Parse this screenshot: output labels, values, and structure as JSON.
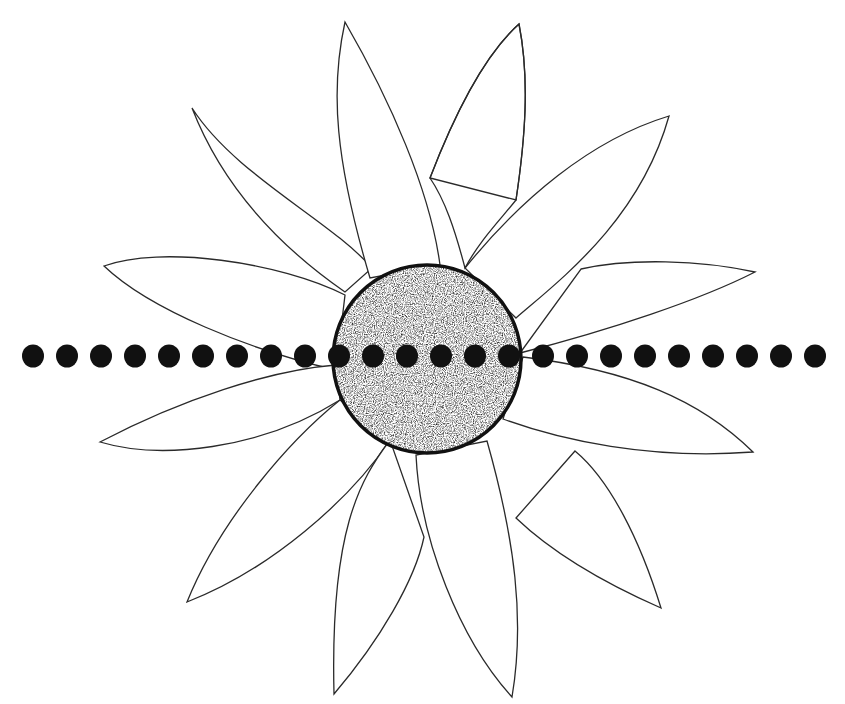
{
  "figure": {
    "background_color": "#ffffff",
    "line_color": "#2a2a2a",
    "petal_count": 16,
    "center": {
      "label": "stippled-center-disc",
      "cx": 427,
      "cy": 359,
      "r": 94,
      "fill": "stipple",
      "stroke_color": "#111111"
    },
    "dot_row": {
      "label": "dotted-line",
      "count": 24,
      "y": 356,
      "start_x": 33,
      "spacing": 34,
      "radius": 11,
      "color": "#111111"
    }
  }
}
